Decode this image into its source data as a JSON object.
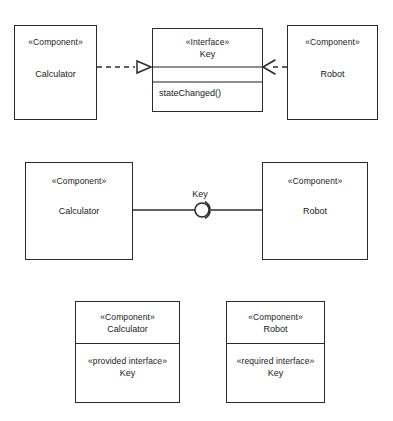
{
  "diagram": {
    "stroke_color": "#2b2b2b",
    "divider_color": "#8e8e8e",
    "background": "#ffffff",
    "figures": [
      {
        "id": "figure-1-realization-dependency",
        "nodes": [
          {
            "id": "calculator-component-top",
            "stereotype": "«Component»",
            "name": "Calculator"
          },
          {
            "id": "key-interface",
            "stereotype": "«Interface»",
            "name": "Key",
            "operations": [
              "stateChanged()"
            ]
          },
          {
            "id": "robot-component-top",
            "stereotype": "«Component»",
            "name": "Robot"
          }
        ],
        "connectors": [
          {
            "id": "realization-calculator-to-key",
            "kind": "realization",
            "line": "dashed",
            "arrowhead": "hollow-triangle",
            "from": "calculator-component-top",
            "to": "key-interface"
          },
          {
            "id": "dependency-robot-to-key",
            "kind": "dependency",
            "line": "dashed",
            "arrowhead": "open-arrow",
            "from": "robot-component-top",
            "to": "key-interface"
          }
        ]
      },
      {
        "id": "figure-2-assembly-connector",
        "nodes": [
          {
            "id": "calculator-component-mid",
            "stereotype": "«Component»",
            "name": "Calculator"
          },
          {
            "id": "robot-component-mid",
            "stereotype": "«Component»",
            "name": "Robot"
          }
        ],
        "connectors": [
          {
            "id": "assembly-connector-key",
            "kind": "ball-and-socket",
            "line": "solid",
            "label": "Key",
            "from": "calculator-component-mid",
            "to": "robot-component-mid"
          }
        ]
      },
      {
        "id": "figure-3-interface-compartments",
        "nodes": [
          {
            "id": "calculator-component-bottom",
            "stereotype": "«Component»",
            "name": "Calculator",
            "compartment_stereotype": "«provided interface»",
            "compartment_name": "Key"
          },
          {
            "id": "robot-component-bottom",
            "stereotype": "«Component»",
            "name": "Robot",
            "compartment_stereotype": "«required interface»",
            "compartment_name": "Key"
          }
        ]
      }
    ]
  }
}
